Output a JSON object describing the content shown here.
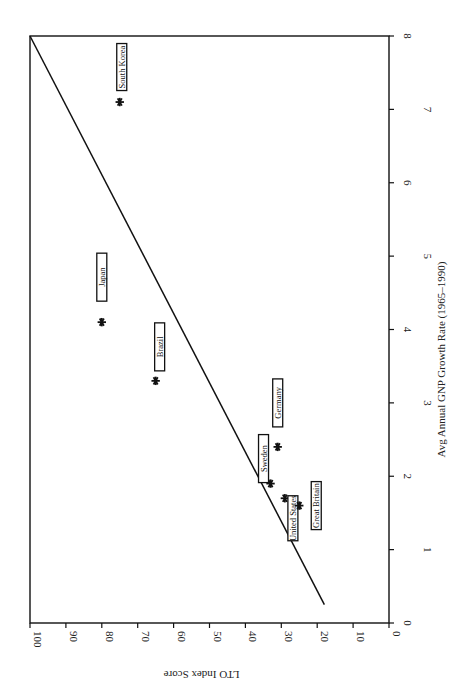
{
  "chart_data": {
    "type": "scatter",
    "orientation": "rotated-90-clockwise",
    "title": "",
    "xlabel": "Avg Annual GNP Growth Rate (1965–1990)",
    "ylabel": "LTO Index Score",
    "xlim": [
      0,
      8
    ],
    "ylim": [
      0,
      100
    ],
    "x_ticks": [
      0,
      1,
      2,
      3,
      4,
      5,
      6,
      7,
      8
    ],
    "y_ticks": [
      0,
      10,
      20,
      30,
      40,
      50,
      60,
      70,
      80,
      90,
      100
    ],
    "grid": false,
    "legend": null,
    "marker": "asterisk",
    "points": [
      {
        "label": "South Korea",
        "x": 7.1,
        "y": 75
      },
      {
        "label": "Japan",
        "x": 4.1,
        "y": 80
      },
      {
        "label": "Brazil",
        "x": 3.3,
        "y": 65
      },
      {
        "label": "Germany",
        "x": 2.4,
        "y": 31
      },
      {
        "label": "Sweden",
        "x": 1.9,
        "y": 33
      },
      {
        "label": "United States",
        "x": 1.7,
        "y": 29
      },
      {
        "label": "Great Britain",
        "x": 1.6,
        "y": 25
      }
    ],
    "trend_line": {
      "x": [
        0.25,
        8
      ],
      "y": [
        18,
        100
      ]
    }
  },
  "colors": {
    "ink": "#111111",
    "background": "#ffffff"
  }
}
